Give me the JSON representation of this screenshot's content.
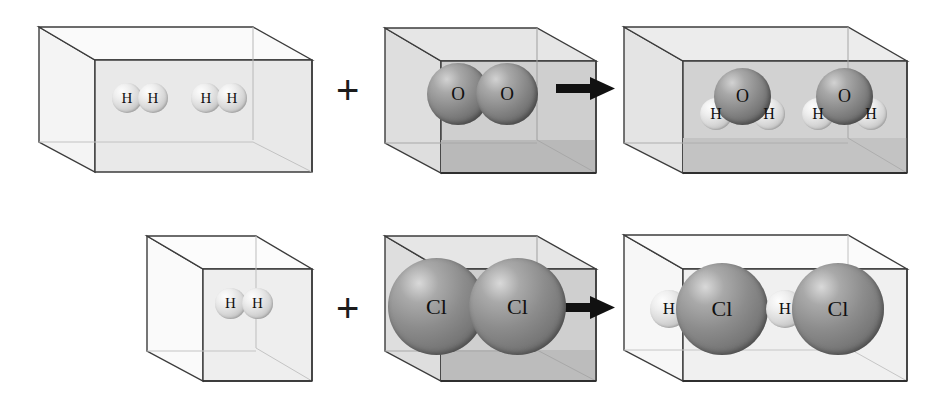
{
  "diagram": {
    "operator_plus": "+",
    "operator_arrow": "arrow-right",
    "atom_colors": {
      "hydrogen": "#e2e2e2",
      "oxygen": "#7d7d7d",
      "chlorine": "#838383",
      "label": "#101010",
      "box_edge": "#3c3c3c",
      "box_fill_light": "#f0f0f0",
      "box_fill_mid": "#d7d7d7",
      "box_fill_dark": "#bdbdbd"
    },
    "rows": [
      {
        "id": "reaction-water",
        "equation": "2 H2 + O2 -> 2 H2O",
        "panels": [
          {
            "id": "reactant-hydrogen",
            "role": "reactant",
            "container": "wide-box",
            "shading": "light",
            "species": "H2",
            "count": 2,
            "molecules": [
              {
                "name": "hydrogen-molecule",
                "atoms": [
                  {
                    "element": "H",
                    "label": "H"
                  },
                  {
                    "element": "H",
                    "label": "H"
                  }
                ]
              },
              {
                "name": "hydrogen-molecule",
                "atoms": [
                  {
                    "element": "H",
                    "label": "H"
                  },
                  {
                    "element": "H",
                    "label": "H"
                  }
                ]
              }
            ]
          },
          {
            "id": "reactant-oxygen",
            "role": "reactant",
            "container": "cube",
            "shading": "dark",
            "species": "O2",
            "count": 1,
            "molecules": [
              {
                "name": "oxygen-molecule",
                "atoms": [
                  {
                    "element": "O",
                    "label": "O"
                  },
                  {
                    "element": "O",
                    "label": "O"
                  }
                ]
              }
            ]
          },
          {
            "id": "product-water",
            "role": "product",
            "container": "wide-box",
            "shading": "dark",
            "species": "H2O",
            "count": 2,
            "molecules": [
              {
                "name": "water-molecule",
                "atoms": [
                  {
                    "element": "O",
                    "label": "O"
                  },
                  {
                    "element": "H",
                    "label": "H"
                  },
                  {
                    "element": "H",
                    "label": "H"
                  }
                ]
              },
              {
                "name": "water-molecule",
                "atoms": [
                  {
                    "element": "O",
                    "label": "O"
                  },
                  {
                    "element": "H",
                    "label": "H"
                  },
                  {
                    "element": "H",
                    "label": "H"
                  }
                ]
              }
            ]
          }
        ]
      },
      {
        "id": "reaction-hydrogen-chloride",
        "equation": "H2 + Cl2 -> 2 HCl",
        "panels": [
          {
            "id": "reactant-hydrogen-small",
            "role": "reactant",
            "container": "cube",
            "shading": "light",
            "species": "H2",
            "count": 1,
            "molecules": [
              {
                "name": "hydrogen-molecule",
                "atoms": [
                  {
                    "element": "H",
                    "label": "H"
                  },
                  {
                    "element": "H",
                    "label": "H"
                  }
                ]
              }
            ]
          },
          {
            "id": "reactant-chlorine",
            "role": "reactant",
            "container": "cube",
            "shading": "dark",
            "species": "Cl2",
            "count": 1,
            "molecules": [
              {
                "name": "chlorine-molecule",
                "atoms": [
                  {
                    "element": "Cl",
                    "label": "Cl"
                  },
                  {
                    "element": "Cl",
                    "label": "Cl"
                  }
                ]
              }
            ]
          },
          {
            "id": "product-hydrogen-chloride",
            "role": "product",
            "container": "wide-box",
            "shading": "light",
            "species": "HCl",
            "count": 2,
            "molecules": [
              {
                "name": "hydrogen-chloride-molecule",
                "atoms": [
                  {
                    "element": "H",
                    "label": "H"
                  },
                  {
                    "element": "Cl",
                    "label": "Cl"
                  }
                ]
              },
              {
                "name": "hydrogen-chloride-molecule",
                "atoms": [
                  {
                    "element": "H",
                    "label": "H"
                  },
                  {
                    "element": "Cl",
                    "label": "Cl"
                  }
                ]
              }
            ]
          }
        ]
      }
    ],
    "labels": {
      "r0p0m0a0": "H",
      "r0p0m0a1": "H",
      "r0p0m1a0": "H",
      "r0p0m1a1": "H",
      "r0p1m0a0": "O",
      "r0p1m0a1": "O",
      "r0p2m0a0": "O",
      "r0p2m0a1": "H",
      "r0p2m0a2": "H",
      "r0p2m1a0": "O",
      "r0p2m1a1": "H",
      "r0p2m1a2": "H",
      "r1p0m0a0": "H",
      "r1p0m0a1": "H",
      "r1p1m0a0": "Cl",
      "r1p1m0a1": "Cl",
      "r1p2m0a0": "H",
      "r1p2m0a1": "Cl",
      "r1p2m1a0": "H",
      "r1p2m1a1": "Cl",
      "plus0": "+",
      "plus1": "+"
    }
  }
}
